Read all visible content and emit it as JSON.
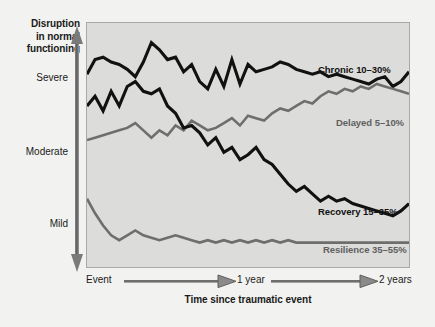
{
  "figure": {
    "background_color": "#f2f2f0",
    "plot_background_color": "#dcdcda",
    "plot_border_color": "#a8a8a6"
  },
  "axes": {
    "y_title_line1": "Disruption",
    "y_title_line2": "in normal",
    "y_title_line3": "functioning",
    "y_ticks": [
      "Severe",
      "Moderate",
      "Mild"
    ],
    "y_tick_severe": "Severe",
    "y_tick_moderate": "Moderate",
    "y_tick_mild": "Mild",
    "x_title": "Time since traumatic event",
    "x_ticks": [
      "Event",
      "1 year",
      "2 years"
    ],
    "x_tick_event": "Event",
    "x_tick_1year": "1 year",
    "x_tick_2years": "2 years"
  },
  "series_labels": {
    "chronic": "Chronic 10–30%",
    "delayed": "Delayed 5–10%",
    "recovery": "Recovery 15–35%",
    "resilience": "Resilience 35–55%"
  },
  "chart_data": {
    "type": "line",
    "title": "",
    "subtitle": "",
    "xlabel": "Time since traumatic event",
    "ylabel": "Disruption in normal functioning",
    "xlim": [
      0,
      100
    ],
    "ylim": [
      0,
      100
    ],
    "x_tick_labels": [
      "Event",
      "1 year",
      "2 years"
    ],
    "x_tick_positions": [
      0,
      50,
      100
    ],
    "y_tick_labels": [
      "Mild",
      "Moderate",
      "Severe"
    ],
    "y_tick_positions": [
      20,
      50,
      80
    ],
    "grid": false,
    "legend_position": "inline-annotations",
    "y_axis_direction": "up = more disruption",
    "note": "Four prototypical trajectory outcomes after a potentially traumatic event. Percentages are the share of exposed people following each trajectory. Lines are jagged/noisy time series sampled roughly every 2.5 units of x.",
    "series": [
      {
        "name": "Chronic 10–30%",
        "color": "#111111",
        "label_text": "Chronic 10–30%",
        "x": [
          0,
          2.5,
          5,
          7.5,
          10,
          12.5,
          15,
          17.5,
          20,
          22.5,
          25,
          27.5,
          30,
          32.5,
          35,
          37.5,
          40,
          42.5,
          45,
          47.5,
          50,
          52.5,
          55,
          57.5,
          60,
          62.5,
          65,
          67.5,
          70,
          72.5,
          75,
          77.5,
          80,
          82.5,
          85,
          87.5,
          90,
          92.5,
          95,
          97.5,
          100
        ],
        "y": [
          79,
          85,
          86,
          84,
          83,
          81,
          78,
          84,
          92,
          89,
          85,
          86,
          80,
          83,
          76,
          73,
          81,
          74,
          85,
          75,
          83,
          80,
          81,
          82,
          84,
          83,
          81,
          80,
          79,
          80,
          78,
          79,
          78,
          77,
          76,
          75,
          77,
          78,
          74,
          76,
          80
        ]
      },
      {
        "name": "Delayed 5–10%",
        "color": "#6e6e6e",
        "label_text": "Delayed 5–10%",
        "x": [
          0,
          2.5,
          5,
          7.5,
          10,
          12.5,
          15,
          17.5,
          20,
          22.5,
          25,
          27.5,
          30,
          32.5,
          35,
          37.5,
          40,
          42.5,
          45,
          47.5,
          50,
          52.5,
          55,
          57.5,
          60,
          62.5,
          65,
          67.5,
          70,
          72.5,
          75,
          77.5,
          80,
          82.5,
          85,
          87.5,
          90,
          92.5,
          95,
          97.5,
          100
        ],
        "y": [
          52,
          53,
          54,
          55,
          56,
          57,
          59,
          56,
          53,
          56,
          54,
          58,
          56,
          60,
          58,
          56,
          57,
          59,
          61,
          58,
          62,
          61,
          60,
          63,
          65,
          64,
          66,
          68,
          67,
          70,
          72,
          71,
          73,
          72,
          74,
          73,
          75,
          74,
          73,
          72,
          71
        ]
      },
      {
        "name": "Recovery 15–35%",
        "color": "#111111",
        "label_text": "Recovery 15–35%",
        "x": [
          0,
          2.5,
          5,
          7.5,
          10,
          12.5,
          15,
          17.5,
          20,
          22.5,
          25,
          27.5,
          30,
          32.5,
          35,
          37.5,
          40,
          42.5,
          45,
          47.5,
          50,
          52.5,
          55,
          57.5,
          60,
          62.5,
          65,
          67.5,
          70,
          72.5,
          75,
          77.5,
          80,
          82.5,
          85,
          87.5,
          90,
          92.5,
          95,
          97.5,
          100
        ],
        "y": [
          66,
          70,
          64,
          72,
          66,
          74,
          76,
          72,
          71,
          73,
          66,
          63,
          57,
          58,
          55,
          50,
          53,
          47,
          49,
          44,
          46,
          49,
          44,
          42,
          38,
          34,
          31,
          33,
          30,
          27,
          29,
          27,
          28,
          26,
          25,
          24,
          23,
          22,
          21,
          23,
          26
        ]
      },
      {
        "name": "Resilience 35–55%",
        "color": "#6e6e6e",
        "label_text": "Resilience 35–55%",
        "x": [
          0,
          2.5,
          5,
          7.5,
          10,
          12.5,
          15,
          17.5,
          20,
          22.5,
          25,
          27.5,
          30,
          32.5,
          35,
          37.5,
          40,
          42.5,
          45,
          47.5,
          50,
          52.5,
          55,
          57.5,
          60,
          62.5,
          65,
          67.5,
          70,
          72.5,
          75,
          77.5,
          80,
          82.5,
          85,
          87.5,
          90,
          92.5,
          95,
          97.5,
          100
        ],
        "y": [
          28,
          22,
          17,
          13,
          11,
          13,
          15,
          13,
          12,
          11,
          12,
          13,
          12,
          11,
          10,
          11,
          10,
          11,
          10,
          11,
          10,
          11,
          10,
          11,
          10,
          11,
          10,
          10,
          10,
          10,
          10,
          10,
          10,
          10,
          10,
          10,
          10,
          10,
          10,
          10,
          10
        ]
      }
    ]
  }
}
